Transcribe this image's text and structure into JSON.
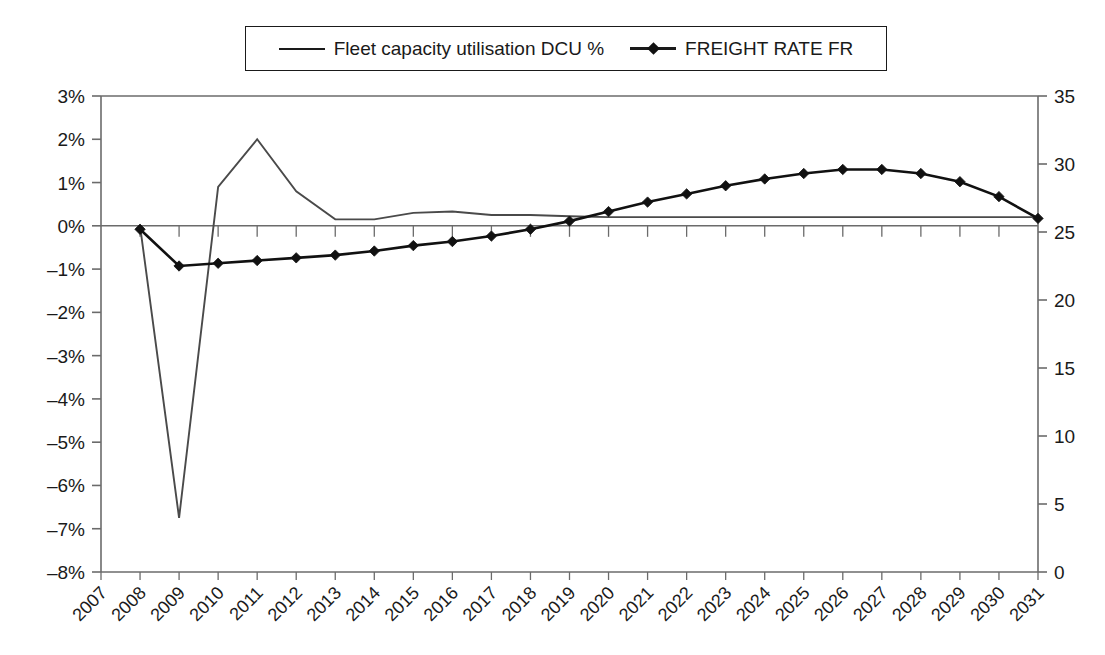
{
  "legend": {
    "position": "top-center",
    "entries": [
      {
        "label": "Fleet capacity utilisation DCU %",
        "marker": "line",
        "icon": "line-swatch-icon"
      },
      {
        "label": "FREIGHT RATE FR",
        "marker": "line-diamond",
        "icon": "line-diamond-swatch-icon"
      }
    ]
  },
  "axes": {
    "left": {
      "ticks": [
        "3%",
        "2%",
        "1%",
        "0%",
        "–1%",
        "–2%",
        "–3%",
        "–4%",
        "–5%",
        "–6%",
        "–7%",
        "–8%"
      ],
      "min": -8,
      "max": 3,
      "step": 1,
      "label": ""
    },
    "right": {
      "ticks": [
        "35",
        "30",
        "25",
        "20",
        "15",
        "10",
        "5",
        "0"
      ],
      "min": 0,
      "max": 35,
      "step": 5,
      "label": ""
    },
    "bottom": {
      "ticks": [
        "2007",
        "2008",
        "2009",
        "2010",
        "2011",
        "2012",
        "2013",
        "2014",
        "2015",
        "2016",
        "2017",
        "2018",
        "2019",
        "2020",
        "2021",
        "2022",
        "2023",
        "2024",
        "2025",
        "2026",
        "2027",
        "2028",
        "2029",
        "2030",
        "2031"
      ],
      "rotation": -45
    }
  },
  "colors": {
    "line": "#3a3a3a",
    "series_dcu": "#4a4a4a",
    "series_fr": "#111111",
    "axis": "#6b6b6b",
    "text": "#1a1a1a",
    "background": "#ffffff"
  },
  "chart_data": {
    "type": "line",
    "title": "",
    "subtitle": "",
    "xlabel": "",
    "ylabel": "",
    "grid": false,
    "legend_position": "top-center",
    "x": [
      "2007",
      "2008",
      "2009",
      "2010",
      "2011",
      "2012",
      "2013",
      "2014",
      "2015",
      "2016",
      "2017",
      "2018",
      "2019",
      "2020",
      "2021",
      "2022",
      "2023",
      "2024",
      "2025",
      "2026",
      "2027",
      "2028",
      "2029",
      "2030",
      "2031"
    ],
    "y_left": {
      "label": "Fleet capacity utilisation DCU %",
      "min": -8,
      "max": 3,
      "step": 1,
      "unit": "%"
    },
    "y_right": {
      "label": "FREIGHT RATE FR",
      "min": 0,
      "max": 35,
      "step": 5,
      "unit": ""
    },
    "series": [
      {
        "name": "Fleet capacity utilisation DCU %",
        "axis": "left",
        "marker": "none",
        "color": "#4a4a4a",
        "values": [
          null,
          0.0,
          -6.75,
          0.9,
          2.0,
          0.8,
          0.15,
          0.15,
          0.3,
          0.33,
          0.25,
          0.25,
          0.22,
          0.2,
          0.2,
          0.2,
          0.2,
          0.2,
          0.2,
          0.2,
          0.2,
          0.2,
          0.2,
          0.2,
          0.2
        ]
      },
      {
        "name": "FREIGHT RATE FR",
        "axis": "right",
        "marker": "diamond",
        "color": "#111111",
        "values": [
          null,
          25.2,
          22.5,
          22.7,
          22.9,
          23.1,
          23.3,
          23.6,
          24.0,
          24.3,
          24.7,
          25.2,
          25.8,
          26.5,
          27.2,
          27.8,
          28.4,
          28.9,
          29.3,
          29.6,
          29.6,
          29.3,
          28.7,
          27.6,
          26.0
        ]
      }
    ]
  }
}
